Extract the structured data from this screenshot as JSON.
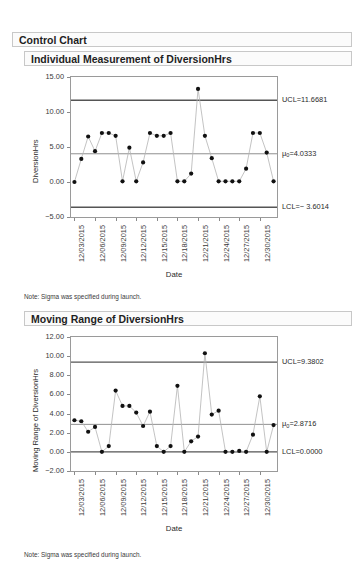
{
  "report": {
    "title": "Control Chart"
  },
  "charts": [
    {
      "id": "individual-measurement",
      "title": "Individual Measurement of DiversionHrs",
      "note": "Note: Sigma was specified during launch.",
      "ylabel": "DiversionHrs",
      "xlabel": "Date",
      "yticks": [
        "15.00",
        "10.00",
        "5.00",
        "0.00",
        "-5.00"
      ],
      "ytick_values": [
        15,
        10,
        5,
        0,
        -5
      ],
      "limits": [
        {
          "name": "ucl",
          "label": "UCL=11.6681",
          "value": 11.6681
        },
        {
          "name": "center",
          "label": "μ₀=4.0333",
          "value": 4.0333
        },
        {
          "name": "lcl",
          "label": "LCL=− 3.6014",
          "value": -3.6014
        }
      ]
    },
    {
      "id": "moving-range",
      "title": "Moving Range of DiversionHrs",
      "note": "Note: Sigma was specified during launch.",
      "ylabel": "Moving Range of DiversionHrs",
      "xlabel": "Date",
      "yticks": [
        "12.00",
        "10.00",
        "8.00",
        "6.00",
        "4.00",
        "2.00",
        "0.00",
        "-2.00"
      ],
      "ytick_values": [
        12,
        10,
        8,
        6,
        4,
        2,
        0,
        -2
      ],
      "limits": [
        {
          "name": "ucl",
          "label": "UCL=9.3802",
          "value": 9.3802
        },
        {
          "name": "center",
          "label": "μ₀=2.8716",
          "value": 2.8716
        },
        {
          "name": "lcl",
          "label": "LCL=0.0000",
          "value": 0.0
        }
      ]
    }
  ],
  "chart_data": [
    {
      "type": "line",
      "title": "Individual Measurement of DiversionHrs",
      "xlabel": "Date",
      "ylabel": "DiversionHrs",
      "ylim": [
        -5,
        15
      ],
      "grid": false,
      "legend": "none",
      "xtick_labels": [
        "12/03/2015",
        "12/06/2015",
        "12/09/2015",
        "12/12/2015",
        "12/15/2015",
        "12/18/2015",
        "12/21/2015",
        "12/24/2015",
        "12/27/2015",
        "12/30/2015"
      ],
      "xtick_index": [
        1,
        4,
        7,
        10,
        13,
        16,
        19,
        22,
        25,
        28
      ],
      "x": [
        1,
        2,
        3,
        4,
        5,
        6,
        7,
        8,
        9,
        10,
        11,
        12,
        13,
        14,
        15,
        16,
        17,
        18,
        19,
        20,
        21,
        22,
        23,
        24,
        25,
        26,
        27,
        28,
        29,
        30
      ],
      "values": [
        0.0,
        3.3,
        6.5,
        4.4,
        7.0,
        7.0,
        6.6,
        0.1,
        4.9,
        0.1,
        2.8,
        7.0,
        6.6,
        6.6,
        7.0,
        0.1,
        0.1,
        1.2,
        13.3,
        6.6,
        3.4,
        0.1,
        0.1,
        0.1,
        0.1,
        1.9,
        7.0,
        7.0,
        4.2,
        0.1
      ],
      "control_lines": [
        {
          "name": "UCL",
          "value": 11.6681,
          "label": "UCL=11.6681"
        },
        {
          "name": "Center",
          "value": 4.0333,
          "label": "μ₀=4.0333"
        },
        {
          "name": "LCL",
          "value": -3.6014,
          "label": "LCL=− 3.6014"
        }
      ]
    },
    {
      "type": "line",
      "title": "Moving Range of DiversionHrs",
      "xlabel": "Date",
      "ylabel": "Moving Range of DiversionHrs",
      "ylim": [
        -2,
        12
      ],
      "grid": false,
      "legend": "none",
      "xtick_labels": [
        "12/03/2015",
        "12/06/2015",
        "12/09/2015",
        "12/12/2015",
        "12/15/2015",
        "12/18/2015",
        "12/21/2015",
        "12/24/2015",
        "12/27/2015",
        "12/30/2015"
      ],
      "xtick_index": [
        1,
        4,
        7,
        10,
        13,
        16,
        19,
        22,
        25,
        28
      ],
      "x": [
        1,
        2,
        3,
        4,
        5,
        6,
        7,
        8,
        9,
        10,
        11,
        12,
        13,
        14,
        15,
        16,
        17,
        18,
        19,
        20,
        21,
        22,
        23,
        24,
        25,
        26,
        27,
        28,
        29,
        30
      ],
      "values": [
        3.3,
        3.2,
        2.1,
        2.6,
        0.0,
        0.6,
        6.4,
        4.8,
        4.8,
        4.1,
        2.7,
        4.2,
        0.6,
        0.0,
        0.6,
        6.9,
        0.0,
        1.1,
        1.6,
        10.3,
        3.9,
        4.3,
        0.0,
        0.0,
        0.1,
        0.0,
        1.8,
        5.8,
        0.0,
        2.8
      ],
      "control_lines": [
        {
          "name": "UCL",
          "value": 9.3802,
          "label": "UCL=9.3802"
        },
        {
          "name": "Center",
          "value": 2.8716,
          "label": "μ₀=2.8716"
        },
        {
          "name": "LCL",
          "value": 0.0,
          "label": "LCL=0.0000"
        }
      ]
    }
  ]
}
